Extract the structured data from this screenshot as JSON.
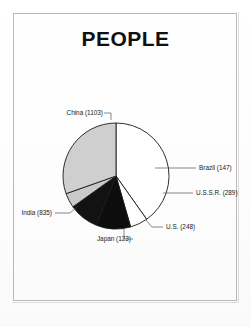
{
  "page": {
    "title": "PEOPLE",
    "background_color": "#fefefe",
    "frame_color": "#b9b9b9"
  },
  "chart_data": {
    "type": "pie",
    "title": "PEOPLE",
    "xlabel": "",
    "ylabel": "",
    "legend_position": "none",
    "grid": false,
    "total": 2745,
    "categories": [
      "China",
      "Brazil",
      "U.S.S.R.",
      "U.S.",
      "Japan",
      "India"
    ],
    "values": [
      1103,
      147,
      289,
      248,
      123,
      835
    ],
    "labels": [
      "China (1103)",
      "Brazil (147)",
      "U.S.S.R. (289)",
      "U.S. (248)",
      "Japan (123)",
      "India (835)"
    ],
    "slices": [
      {
        "name": "China",
        "value": 1103,
        "label": "China (1103)",
        "fill": "#ffffff",
        "start_angle": 0,
        "end_angle": 144.7
      },
      {
        "name": "Brazil",
        "value": 147,
        "label": "Brazil (147)",
        "fill": "#ffffff",
        "start_angle": 144.7,
        "end_angle": 164.0
      },
      {
        "name": "U.S.S.R.",
        "value": 289,
        "label": "U.S.S.R. (289)",
        "fill": "#0d0d0d",
        "start_angle": 164.0,
        "end_angle": 201.9
      },
      {
        "name": "U.S.",
        "value": 248,
        "label": "U.S. (248)",
        "fill": "#121212",
        "start_angle": 201.9,
        "end_angle": 234.4
      },
      {
        "name": "Japan",
        "value": 123,
        "label": "Japan (123)",
        "fill": "#c9c9c9",
        "start_angle": 234.4,
        "end_angle": 250.5
      },
      {
        "name": "India",
        "value": 835,
        "label": "India (835)",
        "fill": "#cfcfcf",
        "start_angle": 250.5,
        "end_angle": 360
      }
    ]
  }
}
